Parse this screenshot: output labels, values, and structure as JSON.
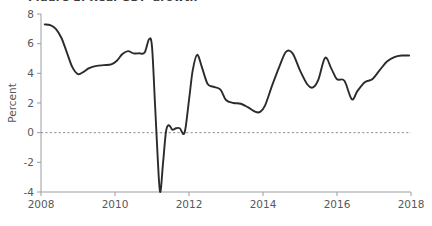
{
  "figure": {
    "partial_title_top": "Figure 1. Real GDP growth",
    "background_color": "#ffffff",
    "line_color": "#2b2b2b",
    "axis_color": "#9b9da0",
    "zero_line_color": "#8d8f92",
    "tick_label_color": "#55585c"
  },
  "chart_data": {
    "type": "line",
    "title": "",
    "xlabel": "",
    "ylabel": "Percent",
    "xlim": [
      2008,
      2018
    ],
    "ylim": [
      -4,
      8
    ],
    "grid": false,
    "legend": "none",
    "zero_reference_line": 0,
    "xticks": [
      2008,
      2010,
      2012,
      2014,
      2016,
      2018
    ],
    "xtick_labels": [
      "2008",
      "2010",
      "2012",
      "2014",
      "2016",
      "2018"
    ],
    "yticks": [
      -4,
      -2,
      0,
      2,
      4,
      6,
      8
    ],
    "ytick_labels": [
      "-4",
      "-2",
      "0",
      "2",
      "4",
      "6",
      "8"
    ],
    "series": [
      {
        "name": "Percent",
        "x": [
          2008.1,
          2008.25,
          2008.4,
          2008.55,
          2008.7,
          2008.85,
          2009.0,
          2009.15,
          2009.3,
          2009.5,
          2009.7,
          2009.9,
          2010.05,
          2010.2,
          2010.35,
          2010.5,
          2010.65,
          2010.8,
          2010.92,
          2011.0,
          2011.08,
          2011.15,
          2011.22,
          2011.3,
          2011.38,
          2011.46,
          2011.55,
          2011.65,
          2011.75,
          2011.88,
          2012.0,
          2012.1,
          2012.22,
          2012.35,
          2012.5,
          2012.65,
          2012.85,
          2013.0,
          2013.2,
          2013.4,
          2013.6,
          2013.8,
          2013.92,
          2014.05,
          2014.25,
          2014.45,
          2014.62,
          2014.8,
          2015.0,
          2015.2,
          2015.35,
          2015.5,
          2015.68,
          2015.85,
          2016.0,
          2016.2,
          2016.4,
          2016.55,
          2016.75,
          2016.95,
          2017.15,
          2017.35,
          2017.55,
          2017.75,
          2017.95
        ],
        "y": [
          7.3,
          7.25,
          7.0,
          6.4,
          5.4,
          4.4,
          3.95,
          4.1,
          4.35,
          4.5,
          4.55,
          4.6,
          4.85,
          5.3,
          5.5,
          5.35,
          5.35,
          5.4,
          6.3,
          5.8,
          2.0,
          -1.5,
          -4.0,
          -2.0,
          0.1,
          0.5,
          0.2,
          0.3,
          0.3,
          0.0,
          2.2,
          4.2,
          5.25,
          4.4,
          3.3,
          3.1,
          2.9,
          2.2,
          2.0,
          1.95,
          1.7,
          1.4,
          1.4,
          1.8,
          3.2,
          4.5,
          5.45,
          5.35,
          4.2,
          3.25,
          3.05,
          3.6,
          5.05,
          4.3,
          3.6,
          3.5,
          2.25,
          2.8,
          3.4,
          3.6,
          4.2,
          4.8,
          5.1,
          5.2,
          5.2
        ]
      }
    ]
  }
}
